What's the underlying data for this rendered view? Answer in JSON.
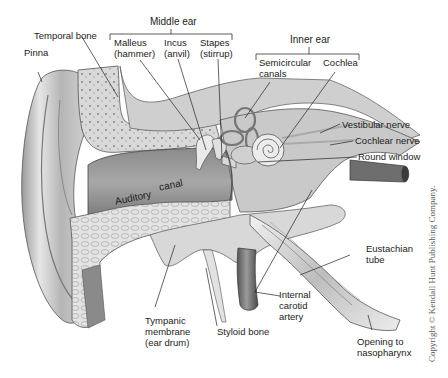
{
  "diagram": {
    "groups": {
      "middle_ear": "Middle ear",
      "inner_ear": "Inner ear"
    },
    "labels": {
      "pinna": "Pinna",
      "temporal_bone": "Temporal bone",
      "malleus": [
        "Malleus",
        "(hammer)"
      ],
      "incus": [
        "Incus",
        "(anvil)"
      ],
      "stapes": [
        "Stapes",
        "(stirrup)"
      ],
      "semicircular_canals": [
        "Semicircular",
        "canals"
      ],
      "cochlea": "Cochlea",
      "vestibular_nerve": "Vestibular nerve",
      "cochlear_nerve": "Cochlear nerve",
      "round_window": "Round window",
      "auditory_canal": [
        "Auditory",
        "canal"
      ],
      "eustachian_tube": [
        "Eustachian",
        "tube"
      ],
      "internal_carotid_artery": [
        "Internal",
        "carotid",
        "artery"
      ],
      "tympanic_membrane": [
        "Tympanic",
        "membrane",
        "(ear drum)"
      ],
      "styloid_bone": "Styloid bone",
      "opening_to_nasopharynx": [
        "Opening to",
        "nasopharynx"
      ]
    },
    "copyright": "Copyright © Kendall Hunt Publishing Company."
  }
}
